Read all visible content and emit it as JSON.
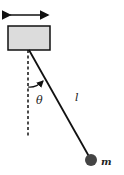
{
  "diagram": {
    "type": "pendulum-on-moving-cart",
    "labels": {
      "angle": "θ",
      "length": "l",
      "mass": "m"
    },
    "colors": {
      "cart_fill": "#dcdcdc",
      "stroke": "#111111",
      "bob": "#444444"
    }
  }
}
